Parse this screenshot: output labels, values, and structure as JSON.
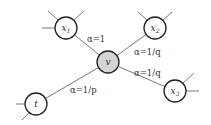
{
  "diagram": {
    "type": "graph",
    "nodes": [
      {
        "id": "x1",
        "label": "x",
        "sub": "1",
        "cx": 66,
        "cy": 28,
        "r": 11,
        "highlighted": false
      },
      {
        "id": "x2",
        "label": "x",
        "sub": "2",
        "cx": 155,
        "cy": 28,
        "r": 11,
        "highlighted": false
      },
      {
        "id": "v",
        "label": "v",
        "sub": "",
        "cx": 108,
        "cy": 62,
        "r": 11,
        "highlighted": true
      },
      {
        "id": "x3",
        "label": "x",
        "sub": "3",
        "cx": 175,
        "cy": 91,
        "r": 11,
        "highlighted": false
      },
      {
        "id": "t",
        "label": "t",
        "sub": "",
        "cx": 36,
        "cy": 104,
        "r": 11,
        "highlighted": false
      }
    ],
    "edges": [
      {
        "from": "v",
        "to": "x1",
        "label": "α=1"
      },
      {
        "from": "v",
        "to": "x2",
        "label": "α=1/q"
      },
      {
        "from": "v",
        "to": "x3",
        "label": "α=1/q"
      },
      {
        "from": "v",
        "to": "t",
        "label": "α=1/p"
      }
    ],
    "edge_labels": {
      "vx1": "α=1",
      "vx2": "α=1/q",
      "vx3": "α=1/q",
      "vt": "α=1/p"
    },
    "node_labels": {
      "x1": "x",
      "x1_sub": "1",
      "x2": "x",
      "x2_sub": "2",
      "v": "v",
      "x3": "x",
      "x3_sub": "3",
      "t": "t"
    },
    "colors": {
      "highlight_fill": "#d4d4d4",
      "node_stroke": "#222222",
      "edge_stroke": "#555555"
    }
  }
}
